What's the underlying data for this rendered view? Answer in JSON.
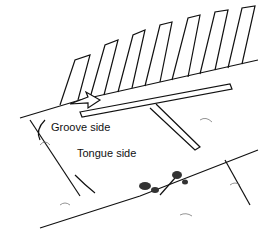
{
  "illustration": {
    "subject": "floor boards with tongue and groove, board used as pry",
    "labels": {
      "groove": "Groove side",
      "tongue": "Tongue side"
    },
    "colors": {
      "ink": "#111111",
      "background": "#ffffff"
    }
  }
}
